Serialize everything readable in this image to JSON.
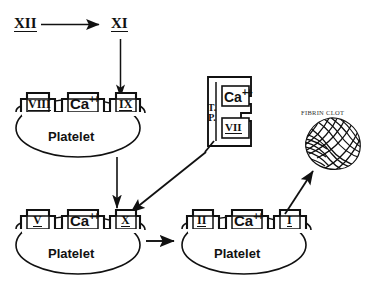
{
  "diagram": {
    "type": "flow-diagram",
    "background_color": "#ffffff",
    "ink_color": "#111111"
  },
  "top_factors": {
    "factor_xii": "XII",
    "factor_xi": "XI"
  },
  "platelet_1": {
    "surface_label": "Platelet",
    "slot_left": "VIII",
    "slot_center": "Ca",
    "slot_center_charge": "++",
    "slot_right": "IX"
  },
  "platelet_2": {
    "surface_label": "Platelet",
    "slot_left": "V",
    "slot_center": "Ca",
    "slot_center_charge": "++",
    "slot_right": "X"
  },
  "platelet_3": {
    "surface_label": "Platelet",
    "slot_left": "II",
    "slot_center": "Ca",
    "slot_center_charge": "++",
    "slot_right": "I"
  },
  "tissue_complex": {
    "tp_line1": "T.",
    "tp_line2": "P.",
    "calcium": "Ca",
    "calcium_charge": "++",
    "factor_vii": "VII"
  },
  "fibrin_clot": {
    "label": "FIBRIN CLOT"
  },
  "arrows": [
    {
      "name": "xii-to-xi",
      "from": "XII",
      "to": "XI",
      "direction": "right"
    },
    {
      "name": "xi-to-ix",
      "from": "XI",
      "to": "IX",
      "direction": "down"
    },
    {
      "name": "platelet1-to-x",
      "from": "Platelet VIII/IX",
      "to": "X",
      "direction": "down"
    },
    {
      "name": "tissue-complex-to-x",
      "from": "T.P./Ca++/VII",
      "to": "X",
      "direction": "down-left"
    },
    {
      "name": "platelet2-to-platelet3",
      "from": "Platelet V/X",
      "to": "Platelet II/I",
      "direction": "right"
    },
    {
      "name": "platelet3-to-clot",
      "from": "Platelet II/I",
      "to": "FIBRIN CLOT",
      "direction": "up-right"
    }
  ]
}
